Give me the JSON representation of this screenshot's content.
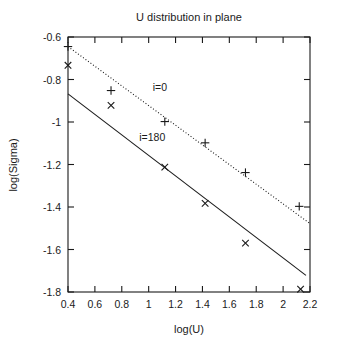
{
  "chart_data": {
    "type": "scatter",
    "title": "U distribution in plane",
    "xlabel": "log(U)",
    "ylabel": "log(Sigma)",
    "xlim": [
      0.4,
      2.2
    ],
    "ylim": [
      -1.8,
      -0.6
    ],
    "xticks": [
      0.4,
      0.6,
      0.8,
      1.0,
      1.2,
      1.4,
      1.6,
      1.8,
      2.0,
      2.2
    ],
    "xticklabels": [
      "0.4",
      "0.6",
      "0.8",
      "1",
      "1.2",
      "1.4",
      "1.6",
      "1.8",
      "2",
      "2.2"
    ],
    "yticks": [
      -0.6,
      -0.8,
      -1.0,
      -1.2,
      -1.4,
      -1.6,
      -1.8
    ],
    "yticklabels": [
      "-0.6",
      "-0.8",
      "-1",
      "-1.2",
      "-1.4",
      "-1.6",
      "-1.8"
    ],
    "grid": false,
    "legend": "inline-annotations",
    "frame": "box",
    "series": [
      {
        "name": "i=0",
        "marker": "plus",
        "fit_style": "dotted",
        "color": "#1a1a1a",
        "annotation": "i=0",
        "annotation_xy": [
          1.03,
          -0.855
        ],
        "points": [
          {
            "x": 0.4,
            "y": -0.645
          },
          {
            "x": 0.72,
            "y": -0.852
          },
          {
            "x": 1.12,
            "y": -0.998
          },
          {
            "x": 1.42,
            "y": -1.098
          },
          {
            "x": 1.72,
            "y": -1.238
          },
          {
            "x": 2.12,
            "y": -1.397
          }
        ],
        "fit_line": {
          "x0": 0.4,
          "y0": -0.645,
          "x1": 2.2,
          "y1": -1.478
        }
      },
      {
        "name": "i=180",
        "marker": "cross",
        "fit_style": "solid",
        "color": "#1a1a1a",
        "annotation": "i=180",
        "annotation_xy": [
          0.93,
          -1.088
        ],
        "points": [
          {
            "x": 0.4,
            "y": -0.733
          },
          {
            "x": 0.72,
            "y": -0.922
          },
          {
            "x": 1.12,
            "y": -1.212
          },
          {
            "x": 1.42,
            "y": -1.383
          },
          {
            "x": 1.72,
            "y": -1.57
          },
          {
            "x": 2.13,
            "y": -1.787
          }
        ],
        "fit_line": {
          "x0": 0.4,
          "y0": -0.868,
          "x1": 2.17,
          "y1": -1.722
        }
      }
    ]
  }
}
